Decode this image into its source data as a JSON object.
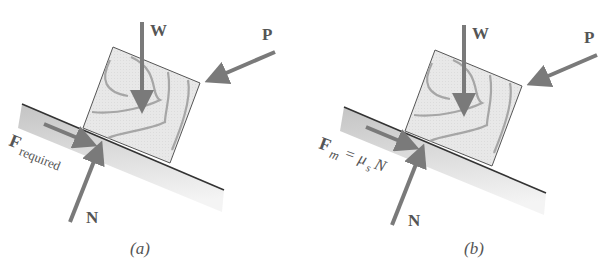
{
  "figure": {
    "panels": [
      {
        "id": "a",
        "caption": "(a)",
        "labels": {
          "weight": "W",
          "push": "P",
          "normal": "N",
          "friction_main": "F",
          "friction_sub": "required"
        }
      },
      {
        "id": "b",
        "caption": "(b)",
        "labels": {
          "weight": "W",
          "push": "P",
          "normal": "N",
          "friction_main": "F",
          "friction_sub": "m",
          "friction_eq": "= μ",
          "friction_eq_sub": "s",
          "friction_eq_tail": "N"
        }
      }
    ],
    "colors": {
      "arrow": "#7a7a7a",
      "block_fill": "#e6e6e6",
      "grain": "#a9a9a9",
      "ramp_top": "#cfcfcf",
      "ramp_bottom": "#f2f2f2",
      "ramp_edge": "#333333",
      "text": "#555555"
    }
  }
}
